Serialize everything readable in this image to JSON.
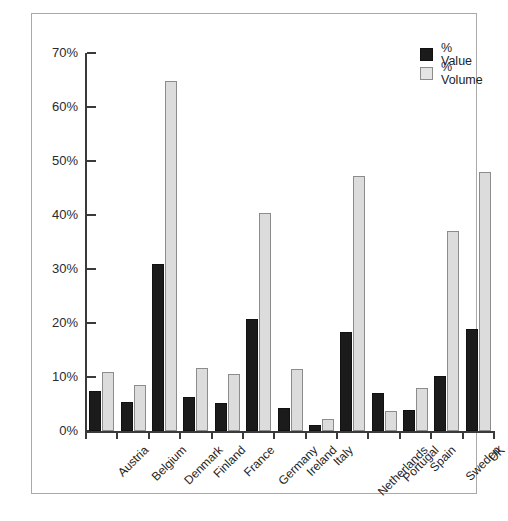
{
  "chart_data": {
    "type": "bar",
    "title": "",
    "subtitle": "",
    "xlabel": "",
    "ylabel": "",
    "ylim": [
      0,
      70
    ],
    "ytick_labels": [
      "0%",
      "10%",
      "20%",
      "30%",
      "40%",
      "50%",
      "60%",
      "70%"
    ],
    "ytick_values": [
      0,
      10,
      20,
      30,
      40,
      50,
      60,
      70
    ],
    "grid": false,
    "legend_position": "top-right",
    "categories": [
      "Austria",
      "Belgium",
      "Denmark",
      "Finland",
      "France",
      "Germany",
      "Ireland",
      "Italy",
      "Netherlands",
      "Portugal",
      "Spain",
      "Sweden",
      "UK"
    ],
    "series": [
      {
        "name": "% Value",
        "color": "#1b1b1b",
        "values": [
          7.4,
          5.4,
          31.0,
          6.3,
          5.2,
          20.7,
          4.3,
          1.1,
          18.3,
          7.0,
          3.9,
          10.2,
          18.9
        ]
      },
      {
        "name": "% Volume",
        "color": "#dcdcdc",
        "values": [
          10.9,
          8.5,
          64.8,
          11.7,
          10.6,
          40.4,
          11.5,
          2.2,
          47.2,
          3.7,
          7.9,
          37.0,
          48.0
        ]
      }
    ]
  },
  "legend": {
    "items": [
      {
        "label": "% Value",
        "swatch": "value"
      },
      {
        "label": "% Volume",
        "swatch": "volume"
      }
    ]
  }
}
